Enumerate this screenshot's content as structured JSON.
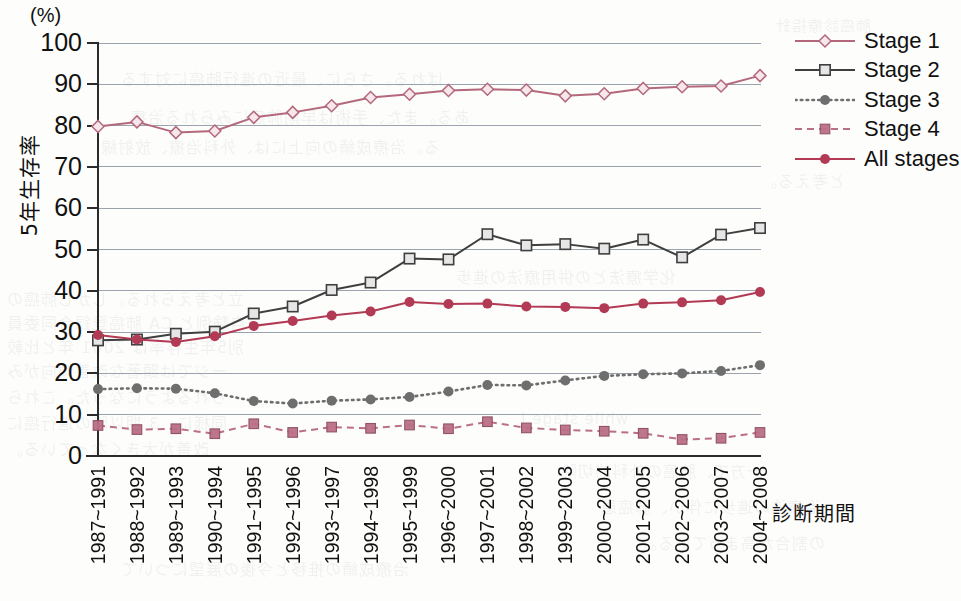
{
  "chart_data": {
    "type": "line",
    "title": "",
    "unit_label": "(%)",
    "xlabel": "診断期間",
    "ylabel": "5年生存率",
    "ylim": [
      0,
      100
    ],
    "ytick_step": 10,
    "yticks": [
      100,
      90,
      80,
      70,
      60,
      50,
      40,
      30,
      20,
      10,
      0
    ],
    "grid": true,
    "legend_position": "right-top",
    "categories": [
      "1987~1991",
      "1988~1992",
      "1989~1993",
      "1990~1994",
      "1991~1995",
      "1992~1996",
      "1993~1997",
      "1994~1998",
      "1995~1999",
      "1996~2000",
      "1997~2001",
      "1998~2002",
      "1999~2003",
      "2000~2004",
      "2001~2005",
      "2002~2006",
      "2003~2007",
      "2004~2008"
    ],
    "series": [
      {
        "name": "Stage 1",
        "color": "#b4687c",
        "marker": "open-diamond",
        "line_style": "solid",
        "values": [
          79.8,
          80.9,
          78.3,
          78.7,
          82.0,
          83.2,
          84.8,
          86.8,
          87.6,
          88.5,
          88.8,
          88.6,
          87.2,
          87.7,
          89.0,
          89.4,
          89.6,
          92.1
        ]
      },
      {
        "name": "Stage 2",
        "color": "#3f3f3f",
        "marker": "open-square",
        "line_style": "solid",
        "values": [
          28.0,
          28.2,
          29.6,
          30.1,
          34.5,
          36.2,
          40.2,
          42.0,
          47.8,
          47.6,
          53.7,
          51.0,
          51.3,
          50.2,
          52.4,
          48.1,
          53.6,
          55.2
        ]
      },
      {
        "name": "Stage 3",
        "color": "#6e6e6e",
        "marker": "filled-circle",
        "line_style": "dotted",
        "values": [
          16.2,
          16.4,
          16.3,
          15.2,
          13.3,
          12.7,
          13.4,
          13.7,
          14.3,
          15.6,
          17.2,
          17.1,
          18.3,
          19.4,
          19.8,
          20.0,
          20.6,
          22.0
        ]
      },
      {
        "name": "Stage 4",
        "color": "#bb6f86",
        "marker": "filled-square",
        "line_style": "dashed",
        "values": [
          7.4,
          6.4,
          6.6,
          5.4,
          7.8,
          5.7,
          7.0,
          6.7,
          7.5,
          6.6,
          8.3,
          6.8,
          6.3,
          6.0,
          5.5,
          4.0,
          4.3,
          5.7
        ]
      },
      {
        "name": "All stages",
        "color": "#b23a54",
        "marker": "filled-circle",
        "line_style": "solid",
        "values": [
          29.3,
          28.2,
          27.6,
          29.0,
          31.5,
          32.7,
          34.0,
          35.0,
          37.3,
          36.8,
          36.9,
          36.2,
          36.1,
          35.8,
          36.9,
          37.2,
          37.7,
          39.7
        ]
      }
    ]
  },
  "legend": {
    "items": [
      {
        "label": "Stage 1"
      },
      {
        "label": "Stage 2"
      },
      {
        "label": "Stage 3"
      },
      {
        "label": "Stage 4"
      },
      {
        "label": "All stages"
      }
    ]
  },
  "ghost_text": [
    {
      "text": "肺癌診療指針",
      "x": 775,
      "y": 14,
      "size": 15
    },
    {
      "text": "ばれる。さらに、最近の進行肺癌に対する",
      "x": 120,
      "y": 66,
      "size": 16
    },
    {
      "text": "ある。また、手術は早期肺癌にみられる治療",
      "x": 130,
      "y": 104,
      "size": 16
    },
    {
      "text": "る。治療成績の向上には、外科治療、放射線",
      "x": 100,
      "y": 134,
      "size": 16
    },
    {
      "text": "と考える。",
      "x": 760,
      "y": 168,
      "size": 16
    },
    {
      "text": "化学療法との併用療法の進歩",
      "x": 455,
      "y": 264,
      "size": 16
    },
    {
      "text": "立と考えられる。しかし肺癌の",
      "x": 6,
      "y": 286,
      "size": 16
    },
    {
      "text": "自験例と CA 肺癌登録合同委員",
      "x": 6,
      "y": 310,
      "size": 16
    },
    {
      "text": "別5年生存率は 2001 年と比較",
      "x": 6,
      "y": 334,
      "size": 16
    },
    {
      "text": "ージでは顕著な改善傾向がみ",
      "x": 6,
      "y": 358,
      "size": 16
    },
    {
      "text": "られるようになった。これら",
      "x": 6,
      "y": 384,
      "size": 16
    },
    {
      "text": "同様に、3 期以降の進行癌に",
      "x": 6,
      "y": 410,
      "size": 16
    },
    {
      "text": "改善が大きくなっている。",
      "x": 6,
      "y": 436,
      "size": 16
    },
    {
      "text": "while stage I",
      "x": 520,
      "y": 410,
      "size": 15
    },
    {
      "text": "一方で、肺癌の外科的切除",
      "x": 560,
      "y": 458,
      "size": 16
    },
    {
      "text": "治療法の進歩に伴い、肺癌患",
      "x": 600,
      "y": 494,
      "size": 16
    },
    {
      "text": "の割合が高まっている。",
      "x": 640,
      "y": 530,
      "size": 16
    },
    {
      "text": "治療成績の推移と今後の展望について",
      "x": 120,
      "y": 556,
      "size": 16
    }
  ]
}
